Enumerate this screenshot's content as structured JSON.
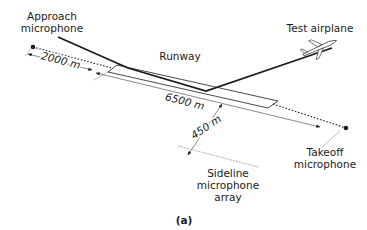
{
  "labels": {
    "approach_mic": [
      "Approach",
      "microphone"
    ],
    "test_airplane": "Test airplane",
    "runway": "Runway",
    "takeoff_mic": [
      "Takeoff",
      "microphone"
    ],
    "sideline_array": [
      "Sideline",
      "microphone",
      "array"
    ],
    "caption": "(a)"
  },
  "dimensions": {
    "approach_distance": "2000 m",
    "runway_length": "6500 m",
    "sideline_distance": "450 m"
  },
  "colors": {
    "line": "#1a1a1a",
    "thin_line": "#555555",
    "background": "#ffffff"
  }
}
